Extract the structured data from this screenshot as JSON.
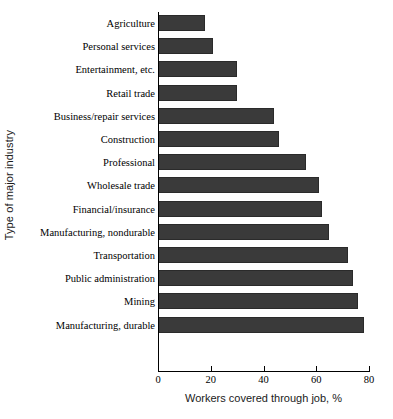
{
  "chart_data": {
    "type": "bar",
    "orientation": "horizontal",
    "title": "",
    "xlabel": "Workers covered through job, %",
    "ylabel": "Type of major industry",
    "xlim": [
      0,
      80
    ],
    "xticks": [
      0,
      20,
      40,
      60,
      80
    ],
    "grid": false,
    "legend": null,
    "bar_color": "#3a3a3a",
    "categories": [
      "Agriculture",
      "Personal services",
      "Entertainment, etc.",
      "Retail trade",
      "Business/repair services",
      "Construction",
      "Professional",
      "Wholesale trade",
      "Financial/insurance",
      "Manufacturing, nondurable",
      "Transportation",
      "Public administration",
      "Mining",
      "Manufacturing, durable"
    ],
    "values": [
      18,
      21,
      30,
      30,
      44,
      46,
      56,
      61,
      62,
      65,
      72,
      74,
      76,
      78
    ]
  }
}
